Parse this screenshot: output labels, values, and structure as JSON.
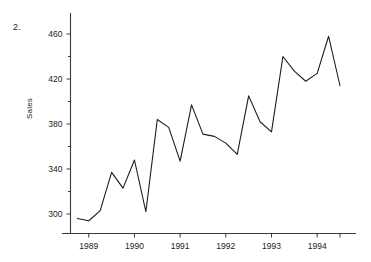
{
  "figure": {
    "problem_number": "2.",
    "background_color": "#ffffff",
    "line_color": "#1c1c1c",
    "axis_color": "#3a3a3a"
  },
  "chart_data": {
    "type": "line",
    "title": "",
    "subtitle": "",
    "xlabel": "",
    "ylabel": "Sales",
    "legend": [],
    "legend_position": "none",
    "grid": false,
    "xlim": [
      1988.6,
      1994.85
    ],
    "ylim": [
      282,
      472
    ],
    "ytick_labels": [
      "300",
      "340",
      "380",
      "420",
      "460"
    ],
    "ytick_values": [
      300,
      340,
      380,
      420,
      460
    ],
    "yminor_ticks": [
      320,
      360,
      400,
      440
    ],
    "xtick_labels": [
      "1989",
      "1990",
      "1991",
      "1992",
      "1993",
      "1994"
    ],
    "xtick_values": [
      1989,
      1990,
      1991,
      1992,
      1993,
      1994
    ],
    "x": [
      1988.75,
      1989.0,
      1989.25,
      1989.5,
      1989.75,
      1990.0,
      1990.25,
      1990.5,
      1990.75,
      1991.0,
      1991.25,
      1991.5,
      1991.75,
      1992.0,
      1992.25,
      1992.5,
      1992.75,
      1993.0,
      1993.25,
      1993.5,
      1993.75,
      1994.0,
      1994.25,
      1994.5
    ],
    "values": [
      296,
      294,
      303,
      337,
      323,
      348,
      302,
      384,
      377,
      347,
      397,
      371,
      369,
      363,
      353,
      405,
      382,
      373,
      440,
      427,
      418,
      425,
      458,
      414
    ],
    "series": [
      {
        "name": "Sales",
        "values": [
          296,
          294,
          303,
          337,
          323,
          348,
          302,
          384,
          377,
          347,
          397,
          371,
          369,
          363,
          353,
          405,
          382,
          373,
          440,
          427,
          418,
          425,
          458,
          414
        ]
      }
    ]
  }
}
